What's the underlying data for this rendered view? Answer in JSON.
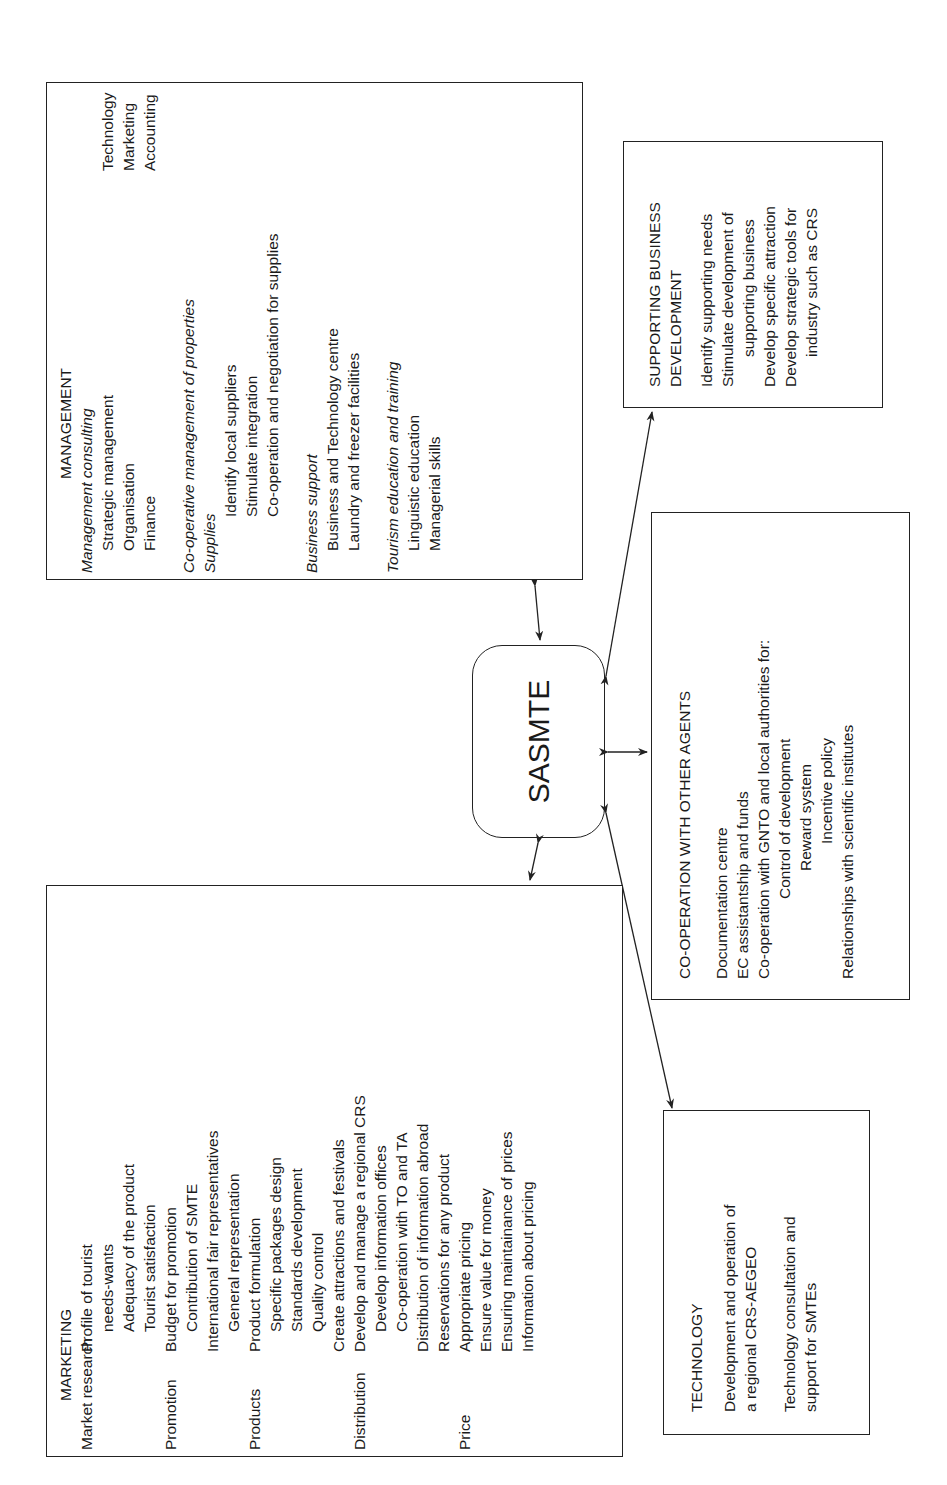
{
  "center": {
    "label": "SASMTE"
  },
  "management": {
    "title": "MANAGEMENT",
    "consulting": {
      "heading": "Management consulting",
      "left": [
        "Strategic management",
        "Organisation",
        "Finance"
      ],
      "right": [
        "Technology",
        "Marketing",
        "Accounting"
      ]
    },
    "cooperative": {
      "heading": "Co-operative management of properties",
      "sub": "Supplies",
      "items": [
        "Identify local suppliers",
        "Stimulate integration",
        "Co-operation and negotiation for supplies"
      ]
    },
    "business_support": {
      "heading": "Business support",
      "items": [
        "Business and Technology centre",
        "Laundry and freezer facilities"
      ]
    },
    "education": {
      "heading": "Tourism education and training",
      "items": [
        "Linguistic education",
        "Managerial skills"
      ]
    }
  },
  "supporting": {
    "title_line1": "SUPPORTING BUSINESS",
    "title_line2": "DEVELOPMENT",
    "items": [
      "Identify supporting needs",
      "Stimulate development of",
      "supporting business",
      "Develop specific attraction",
      "Develop strategic tools for",
      "industry such as CRS"
    ]
  },
  "cooperation": {
    "title": "CO-OPERATION WITH OTHER AGENTS",
    "items": [
      "Documentation centre",
      "EC assistantship and funds",
      "Co-operation with GNTO and local authorities for:"
    ],
    "sub_items": [
      "Control of development",
      "Reward system",
      "Incentive policy"
    ],
    "last": "Relationships with scientific institutes"
  },
  "marketing": {
    "title": "MARKETING",
    "rows": [
      {
        "label": "Market research",
        "text": "Profile of tourist"
      },
      {
        "label": "",
        "text": "needs-wants",
        "indent": true
      },
      {
        "label": "",
        "text": "Adequacy of the product"
      },
      {
        "label": "",
        "text": "Tourist satisfaction"
      },
      {
        "label": "Promotion",
        "text": "Budget for promotion"
      },
      {
        "label": "",
        "text": "Contribution of SMTE"
      },
      {
        "label": "",
        "text": "International fair representatives"
      },
      {
        "label": "",
        "text": "General representation"
      },
      {
        "label": "Products",
        "text": "Product formulation"
      },
      {
        "label": "",
        "text": "Specific packages design"
      },
      {
        "label": "",
        "text": "Standards development"
      },
      {
        "label": "",
        "text": "Quality control"
      },
      {
        "label": "",
        "text": "Create attractions and festivals"
      },
      {
        "label": "Distribution",
        "text": "Develop and manage a regional CRS"
      },
      {
        "label": "",
        "text": "Develop information offices"
      },
      {
        "label": "",
        "text": "Co-operation with TO and TA"
      },
      {
        "label": "",
        "text": "Distribution of information abroad"
      },
      {
        "label": "",
        "text": "Reservations for any product"
      },
      {
        "label": "Price",
        "text": "Appropriate pricing"
      },
      {
        "label": "",
        "text": "Ensure value for money"
      },
      {
        "label": "",
        "text": "Ensuring maintainance of prices"
      },
      {
        "label": "",
        "text": "Information about pricing"
      }
    ]
  },
  "technology": {
    "title": "TECHNOLOGY",
    "items": [
      "Development and operation of",
      "a regional CRS-AEGEO",
      "Technology consultation and",
      "support for SMTEs"
    ]
  }
}
